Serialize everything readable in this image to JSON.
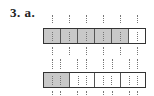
{
  "problem": {
    "label": "3. a."
  },
  "figures": [
    {
      "name": "fraction-bar-sixths",
      "total_parts": 6,
      "shaded_parts": 5,
      "subdivisions_per_part": 2,
      "fraction": "5/6"
    },
    {
      "name": "fraction-bar-fourths",
      "total_parts": 4,
      "shaded_parts": 1,
      "subdivisions_per_part": 3,
      "fraction": "1/4"
    }
  ],
  "colors": {
    "shaded": "#c8c8c8",
    "border": "#333333",
    "background": "#ffffff"
  }
}
